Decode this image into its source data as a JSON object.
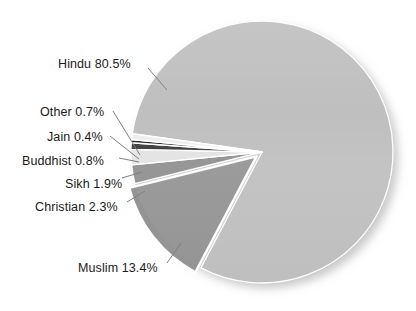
{
  "chart_data": {
    "type": "pie",
    "title": "",
    "subtitle": "",
    "xlabel": "",
    "ylabel": "",
    "legend_position": "none",
    "grid": false,
    "labels_format": "{name} {value}%",
    "categories": [
      "Hindu",
      "Muslim",
      "Christian",
      "Sikh",
      "Buddhist",
      "Jain",
      "Other"
    ],
    "values": [
      80.5,
      13.4,
      2.3,
      1.9,
      0.8,
      0.4,
      0.7
    ],
    "slices": [
      {
        "name": "Hindu",
        "value": 80.5,
        "label": "Hindu 80.5%",
        "color": "#bfbfbf",
        "exploded": false,
        "label_x": 58,
        "label_y": 58,
        "leader": [
          [
            148,
            68
          ],
          [
            167,
            90
          ]
        ]
      },
      {
        "name": "Muslim",
        "value": 13.4,
        "label": "Muslim 13.4%",
        "color": "#949494",
        "exploded": true,
        "label_x": 78,
        "label_y": 262,
        "leader": [
          [
            167,
            263
          ],
          [
            181,
            243
          ]
        ]
      },
      {
        "name": "Christian",
        "value": 2.3,
        "label": "Christian 2.3%",
        "color": "#8f8f8f",
        "exploded": false,
        "label_x": 35,
        "label_y": 201,
        "leader": [
          [
            127,
            202
          ],
          [
            145,
            191
          ]
        ]
      },
      {
        "name": "Sikh",
        "value": 1.9,
        "label": "Sikh 1.9%",
        "color": "#e2e2e2",
        "exploded": false,
        "label_x": 65,
        "label_y": 178,
        "leader": [
          [
            122,
            178
          ],
          [
            142,
            172
          ]
        ]
      },
      {
        "name": "Buddhist",
        "value": 0.8,
        "label": "Buddhist 0.8%",
        "color": "#3b3b3b",
        "exploded": false,
        "label_x": 22,
        "label_y": 155,
        "leader": [
          [
            119,
            158
          ],
          [
            139,
            162
          ]
        ]
      },
      {
        "name": "Jain",
        "value": 0.4,
        "label": "Jain 0.4%",
        "color": "#262626",
        "exploded": false,
        "label_x": 47,
        "label_y": 131,
        "leader": [
          [
            110,
            136
          ],
          [
            139,
            159
          ]
        ]
      },
      {
        "name": "Other",
        "value": 0.7,
        "label": "Other 0.7%",
        "color": "#ededed",
        "exploded": false,
        "label_x": 40,
        "label_y": 106,
        "leader": [
          [
            113,
            111
          ],
          [
            140,
            155
          ]
        ]
      }
    ],
    "colors": {
      "hindu": "#bfbfbf",
      "muslim": "#949494",
      "christian": "#8f8f8f",
      "sikh": "#e2e2e2",
      "buddhist": "#3b3b3b",
      "jain": "#262626",
      "other": "#ededed",
      "separator": "#ffffff",
      "background": "#ffffff",
      "label_text": "#1a1a1a",
      "leader_line": "#808080"
    },
    "geometry": {
      "center_x": 262,
      "center_y": 152,
      "radius": 131,
      "start_angle_deg": 188,
      "direction": "clockwise"
    }
  }
}
